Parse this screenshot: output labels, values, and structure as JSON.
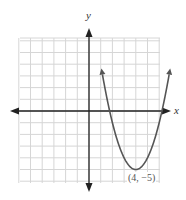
{
  "chart_data": {
    "type": "line",
    "title": "",
    "equation": "y = (x - 4)^2 - 5",
    "xlabel": "x",
    "ylabel": "y",
    "xlim": [
      -6,
      6
    ],
    "ylim": [
      -6,
      6.2
    ],
    "grid": true,
    "grid_step": 1,
    "annotations": [
      {
        "text": "(4, −5)",
        "x": 4,
        "y": -5
      }
    ],
    "series": [
      {
        "name": "parabola",
        "x": [
          1,
          2,
          3,
          4,
          5,
          6,
          7
        ],
        "values": [
          4,
          -1,
          -4,
          -5,
          -4,
          -1,
          4
        ]
      }
    ],
    "vertex": [
      4,
      -5
    ]
  },
  "labels": {
    "x_axis": "x",
    "y_axis": "y",
    "vertex": "(4, −5)"
  },
  "colors": {
    "grid": "#d6d6d6",
    "axis": "#222222",
    "curve": "#555555"
  }
}
